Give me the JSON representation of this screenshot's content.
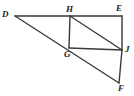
{
  "figure": {
    "name": "geometry-figure-dhegjf",
    "background_color": "#ffffff",
    "stroke_color": "#3a3a3a",
    "stroke_width": 1.4,
    "width": 134,
    "height": 96,
    "vertices": [
      {
        "label": "D",
        "x": 15,
        "y": 16,
        "label_x": 2,
        "label_y": 10
      },
      {
        "label": "H",
        "x": 70,
        "y": 16,
        "label_x": 66,
        "label_y": 5
      },
      {
        "label": "E",
        "x": 122,
        "y": 16,
        "label_x": 116,
        "label_y": 4
      },
      {
        "label": "G",
        "x": 69,
        "y": 48,
        "label_x": 64,
        "label_y": 50
      },
      {
        "label": "J",
        "x": 122,
        "y": 50,
        "label_x": 125,
        "label_y": 45
      },
      {
        "label": "F",
        "x": 119,
        "y": 83,
        "label_x": 118,
        "label_y": 84
      }
    ],
    "segments": [
      {
        "name": "segment-d-e",
        "from": "D",
        "to": "E",
        "x1": 15,
        "y1": 16,
        "x2": 122,
        "y2": 16
      },
      {
        "name": "segment-d-f",
        "from": "D",
        "to": "F",
        "x1": 15,
        "y1": 16,
        "x2": 119,
        "y2": 83
      },
      {
        "name": "segment-h-g",
        "from": "H",
        "to": "G",
        "x1": 70,
        "y1": 16,
        "x2": 69,
        "y2": 48
      },
      {
        "name": "segment-h-j",
        "from": "H",
        "to": "J",
        "x1": 70,
        "y1": 16,
        "x2": 122,
        "y2": 50
      },
      {
        "name": "segment-g-j",
        "from": "G",
        "to": "J",
        "x1": 69,
        "y1": 48,
        "x2": 122,
        "y2": 50
      },
      {
        "name": "segment-e-j",
        "from": "E",
        "to": "J",
        "x1": 122,
        "y1": 16,
        "x2": 122,
        "y2": 50
      },
      {
        "name": "segment-j-f",
        "from": "J",
        "to": "F",
        "x1": 122,
        "y1": 50,
        "x2": 119,
        "y2": 83
      }
    ]
  }
}
